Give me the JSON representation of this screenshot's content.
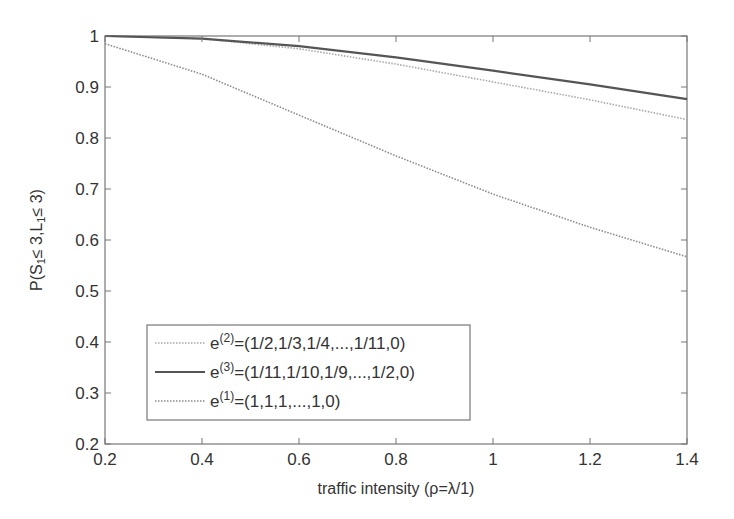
{
  "chart_data": {
    "type": "line",
    "title": "",
    "xlabel": "traffic intensity (ρ=λ/1)",
    "ylabel": "P(S₁≤ 3,L₁≤ 3)",
    "xlim": [
      0.2,
      1.4
    ],
    "ylim": [
      0.2,
      1.0
    ],
    "grid": false,
    "legend_position": "lower-left (inside axes)",
    "x_ticks": [
      "0.2",
      "0.4",
      "0.6",
      "0.8",
      "1",
      "1.2",
      "1.4"
    ],
    "y_ticks": [
      "0.2",
      "0.3",
      "0.4",
      "0.5",
      "0.6",
      "0.7",
      "0.8",
      "0.9",
      "1"
    ],
    "x": [
      0.2,
      0.4,
      0.6,
      0.8,
      1.0,
      1.2,
      1.4
    ],
    "series": [
      {
        "name": "e(2)=(1/2,1/3,1/4,...,1/11,0)",
        "label_base": "e",
        "label_sup": "(2)",
        "label_rest": "=(1/2,1/3,1/4,...,1/11,0)",
        "style": "dotted",
        "color": "#a8a8a8",
        "values": [
          1.0,
          0.995,
          0.975,
          0.945,
          0.91,
          0.875,
          0.836
        ]
      },
      {
        "name": "e(3)=(1/11,1/10,1/9,...,1/2,0)",
        "label_base": "e",
        "label_sup": "(3)",
        "label_rest": "=(1/11,1/10,1/9,...,1/2,0)",
        "style": "solid",
        "color": "#555555",
        "values": [
          1.0,
          0.995,
          0.98,
          0.958,
          0.932,
          0.905,
          0.876
        ]
      },
      {
        "name": "e(1)=(1,1,1,...,1,0)",
        "label_base": "e",
        "label_sup": "(1)",
        "label_rest": "=(1,1,1,...,1,0)",
        "style": "dotted",
        "color": "#8a8a8a",
        "values": [
          0.985,
          0.925,
          0.845,
          0.765,
          0.69,
          0.625,
          0.567
        ]
      }
    ]
  }
}
